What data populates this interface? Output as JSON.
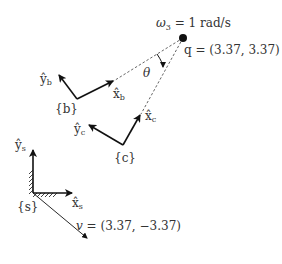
{
  "diagram": {
    "title": "",
    "frames": {
      "s": {
        "label": "{s}",
        "x_axis": "x̂",
        "x_sub": "s",
        "y_axis": "ŷ",
        "y_sub": "s"
      },
      "b": {
        "label": "{b}",
        "x_axis": "x̂",
        "x_sub": "b",
        "y_axis": "ŷ",
        "y_sub": "b"
      },
      "c": {
        "label": "{c}",
        "x_axis": "x̂",
        "x_sub": "c",
        "y_axis": "ŷ",
        "y_sub": "c"
      }
    },
    "point_q": {
      "label": "q = (3.37, 3.37)"
    },
    "omega": {
      "symbol": "ω",
      "sub": "3",
      "rest": " = 1 rad/s"
    },
    "velocity": {
      "label": "v = (3.37, −3.37)"
    },
    "angle": {
      "label": "θ"
    },
    "colors": {
      "stroke": "#111111",
      "dashed": "#555555"
    }
  }
}
